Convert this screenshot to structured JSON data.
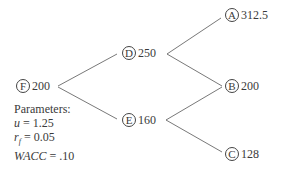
{
  "nodes": {
    "F": {
      "label": "F",
      "value": "200"
    },
    "D": {
      "label": "D",
      "value": "250"
    },
    "E": {
      "label": "E",
      "value": "160"
    },
    "A": {
      "label": "A",
      "value": "312.5"
    },
    "B": {
      "label": "B",
      "value": "200"
    },
    "C": {
      "label": "C",
      "value": "128"
    }
  },
  "edges": [
    [
      "F",
      "D"
    ],
    [
      "F",
      "E"
    ],
    [
      "D",
      "A"
    ],
    [
      "D",
      "B"
    ],
    [
      "E",
      "B"
    ],
    [
      "E",
      "C"
    ]
  ],
  "parameters": {
    "title": "Parameters:",
    "u_symbol": "u",
    "u_value": "= 1.25",
    "rf_symbol": "r",
    "rf_sub": "f",
    "rf_value": "= 0.05",
    "wacc_symbol": "WACC",
    "wacc_value": "= .10"
  }
}
